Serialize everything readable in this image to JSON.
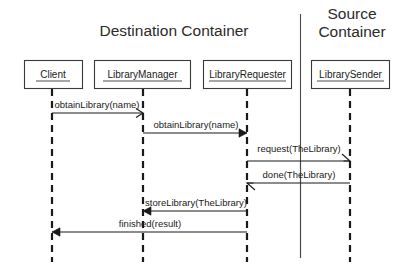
{
  "diagram": {
    "type": "uml-sequence-diagram",
    "background_color": "#ffffff",
    "line_color": "#1a1a1a",
    "containers": [
      {
        "id": "destination",
        "title": "Destination Container"
      },
      {
        "id": "source",
        "title": "Source Container"
      }
    ],
    "participants": [
      {
        "id": "client",
        "label": "Client",
        "container": "destination",
        "x": 52
      },
      {
        "id": "library-manager",
        "label": "LibraryManager",
        "container": "destination",
        "x": 143
      },
      {
        "id": "library-requester",
        "label": "LibraryRequester",
        "container": "destination",
        "x": 247
      },
      {
        "id": "library-sender",
        "label": "LibrarySender",
        "container": "source",
        "x": 350
      }
    ],
    "messages": [
      {
        "seq": 1,
        "label": "obtainLibrary(name)",
        "from": "client",
        "to": "library-manager",
        "direction": "right",
        "y": 113
      },
      {
        "seq": 2,
        "label": "obtainLibrary(name)",
        "from": "library-manager",
        "to": "library-requester",
        "direction": "right",
        "y": 133
      },
      {
        "seq": 3,
        "label": "request(TheLibrary)",
        "from": "library-requester",
        "to": "library-sender",
        "direction": "right",
        "y": 161
      },
      {
        "seq": 4,
        "label": "done(TheLibrary)",
        "from": "library-sender",
        "to": "library-requester",
        "direction": "left",
        "y": 183
      },
      {
        "seq": 5,
        "label": "storeLibrary(TheLibrary)",
        "from": "library-requester",
        "to": "library-manager",
        "direction": "left",
        "y": 211
      },
      {
        "seq": 6,
        "label": "finished(result)",
        "from": "library-requester",
        "to": "client",
        "direction": "left",
        "y": 232
      }
    ]
  }
}
